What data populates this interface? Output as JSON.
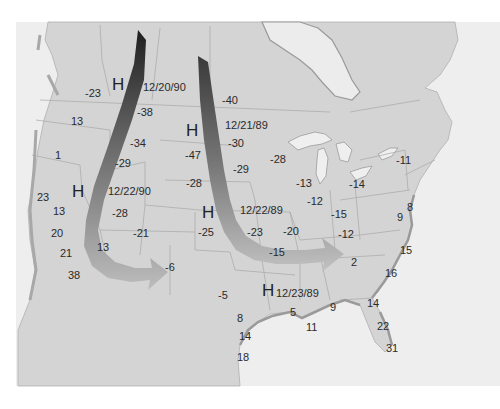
{
  "map": {
    "title": "",
    "colors": {
      "land": "#d4d4d4",
      "water": "#eeeeee",
      "border": "#a8a8a8",
      "coast_shadow": "#9a9a9a",
      "background": "#ffffff",
      "arrow_dark": "#2c2c2c",
      "arrow_light": "#bdbdbd"
    },
    "high_pressure_centers": [
      {
        "symbol": "H",
        "date": "12/20/90",
        "x": 112,
        "y": 76
      },
      {
        "symbol": "H",
        "date": "12/21/89",
        "x": 186,
        "y": 123
      },
      {
        "symbol": "H",
        "date": "12/22/90",
        "x": 72,
        "y": 183
      },
      {
        "symbol": "H",
        "date": "12/22/89",
        "x": 202,
        "y": 205
      },
      {
        "symbol": "H",
        "date": "12/23/89",
        "x": 262,
        "y": 282
      }
    ],
    "temperatures": [
      {
        "value": "-23",
        "x": 85,
        "y": 88
      },
      {
        "value": "13",
        "x": 71,
        "y": 116
      },
      {
        "value": "1",
        "x": 55,
        "y": 150
      },
      {
        "value": "-38",
        "x": 137,
        "y": 107
      },
      {
        "value": "-34",
        "x": 130,
        "y": 138
      },
      {
        "value": "-29",
        "x": 115,
        "y": 158
      },
      {
        "value": "-40",
        "x": 222,
        "y": 95
      },
      {
        "value": "-30",
        "x": 228,
        "y": 138
      },
      {
        "value": "-47",
        "x": 185,
        "y": 150
      },
      {
        "value": "-29",
        "x": 233,
        "y": 164
      },
      {
        "value": "-28",
        "x": 186,
        "y": 178
      },
      {
        "value": "-28",
        "x": 270,
        "y": 154
      },
      {
        "value": "23",
        "x": 37,
        "y": 192
      },
      {
        "value": "13",
        "x": 53,
        "y": 206
      },
      {
        "value": "20",
        "x": 51,
        "y": 228
      },
      {
        "value": "21",
        "x": 60,
        "y": 248
      },
      {
        "value": "38",
        "x": 68,
        "y": 270
      },
      {
        "value": "-28",
        "x": 112,
        "y": 208
      },
      {
        "value": "-21",
        "x": 133,
        "y": 228
      },
      {
        "value": "13",
        "x": 97,
        "y": 242
      },
      {
        "value": "-6",
        "x": 165,
        "y": 262
      },
      {
        "value": "-25",
        "x": 198,
        "y": 227
      },
      {
        "value": "-23",
        "x": 247,
        "y": 227
      },
      {
        "value": "-20",
        "x": 283,
        "y": 226
      },
      {
        "value": "-15",
        "x": 269,
        "y": 247
      },
      {
        "value": "-13",
        "x": 296,
        "y": 178
      },
      {
        "value": "-12",
        "x": 307,
        "y": 196
      },
      {
        "value": "-14",
        "x": 349,
        "y": 179
      },
      {
        "value": "-11",
        "x": 396,
        "y": 155
      },
      {
        "value": "-15",
        "x": 331,
        "y": 209
      },
      {
        "value": "-12",
        "x": 338,
        "y": 229
      },
      {
        "value": "8",
        "x": 407,
        "y": 202
      },
      {
        "value": "9",
        "x": 397,
        "y": 212
      },
      {
        "value": "15",
        "x": 400,
        "y": 245
      },
      {
        "value": "2",
        "x": 351,
        "y": 257
      },
      {
        "value": "16",
        "x": 385,
        "y": 268
      },
      {
        "value": "-5",
        "x": 218,
        "y": 290
      },
      {
        "value": "5",
        "x": 290,
        "y": 307
      },
      {
        "value": "9",
        "x": 330,
        "y": 302
      },
      {
        "value": "11",
        "x": 306,
        "y": 322
      },
      {
        "value": "14",
        "x": 367,
        "y": 298
      },
      {
        "value": "8",
        "x": 237,
        "y": 313
      },
      {
        "value": "14",
        "x": 239,
        "y": 331
      },
      {
        "value": "22",
        "x": 377,
        "y": 321
      },
      {
        "value": "31",
        "x": 386,
        "y": 343
      },
      {
        "value": "18",
        "x": 237,
        "y": 352
      }
    ]
  }
}
